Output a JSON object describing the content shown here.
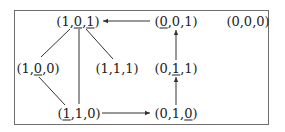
{
  "diagram": {
    "type": "directed-graph",
    "border_color": "#6e6e6e",
    "line_color": "#333333",
    "nodes": [
      {
        "id": "n101",
        "parts": [
          "(1,",
          "0",
          ",",
          "1",
          ")"
        ],
        "underlined": [
          1,
          3
        ],
        "label": "(1,0,1)",
        "x": 78,
        "y": 21
      },
      {
        "id": "n001",
        "parts": [
          "(",
          "0",
          ",0,1)"
        ],
        "underlined": [
          1
        ],
        "label": "(0,0,1)",
        "x": 176,
        "y": 21
      },
      {
        "id": "n000",
        "parts": [
          "(0,0,0)"
        ],
        "underlined": [],
        "label": "(0,0,0)",
        "x": 248,
        "y": 21
      },
      {
        "id": "n100",
        "parts": [
          "(1,",
          "0",
          ",0)"
        ],
        "underlined": [
          1
        ],
        "label": "(1,0,0)",
        "x": 38,
        "y": 68
      },
      {
        "id": "n111",
        "parts": [
          "(1,1,1)"
        ],
        "underlined": [],
        "label": "(1,1,1)",
        "x": 117,
        "y": 68
      },
      {
        "id": "n011",
        "parts": [
          "(0,",
          "1",
          ",1)"
        ],
        "underlined": [
          1
        ],
        "label": "(0,1,1)",
        "x": 176,
        "y": 68
      },
      {
        "id": "n110",
        "parts": [
          "(",
          "1",
          ",1,0)"
        ],
        "underlined": [
          1
        ],
        "label": "(1,1,0)",
        "x": 79,
        "y": 113
      },
      {
        "id": "n010",
        "parts": [
          "(0,1,",
          "0",
          ")"
        ],
        "underlined": [
          1
        ],
        "label": "(0,1,0)",
        "x": 176,
        "y": 113
      }
    ],
    "edges": [
      {
        "from": "n001",
        "to": "n101",
        "arrow": true
      },
      {
        "from": "n011",
        "to": "n001",
        "arrow": true
      },
      {
        "from": "n010",
        "to": "n011",
        "arrow": true
      },
      {
        "from": "n110",
        "to": "n010",
        "arrow": true
      },
      {
        "from": "n101",
        "to": "n100",
        "arrow": false
      },
      {
        "from": "n101",
        "to": "n111",
        "arrow": false
      },
      {
        "from": "n101",
        "to": "n110",
        "arrow": false
      },
      {
        "from": "n100",
        "to": "n110",
        "arrow": false
      }
    ]
  }
}
